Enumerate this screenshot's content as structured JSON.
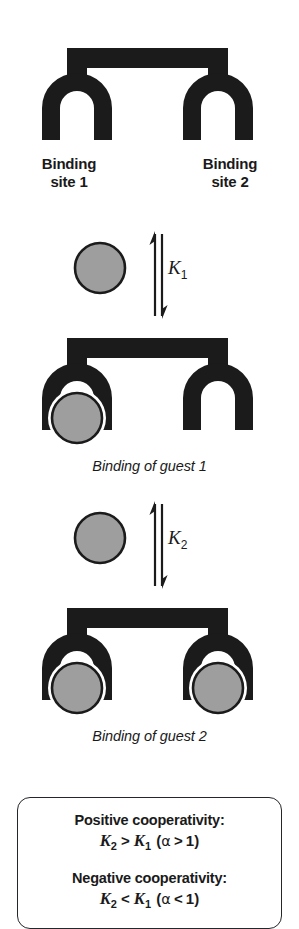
{
  "figure": {
    "type": "host-guest cooperative binding scheme",
    "colors": {
      "host": "#1b1b1b",
      "guest_fill": "#9e9e9e",
      "guest_stroke": "#1b1b1b",
      "background": "#ffffff",
      "box_border": "#23262b",
      "text": "#1a1a1a"
    }
  },
  "top_host": {
    "icon_host": "ditopic-host-icon",
    "icon_site_left": "binding-site-arch-icon",
    "icon_site_right": "binding-site-arch-icon",
    "labels": [
      {
        "line1": "Binding",
        "line2": "site 1"
      },
      {
        "line1": "Binding",
        "line2": "site 2"
      }
    ]
  },
  "step_1": {
    "guest_icon": "guest-sphere-icon",
    "arrow_icon": "equilibrium-arrow-icon",
    "constant": "K",
    "constant_sub": "1"
  },
  "mono_complex": {
    "icon_host": "ditopic-host-icon",
    "icon_guest": "guest-sphere-icon",
    "caption": "Binding of guest 1"
  },
  "step_2": {
    "guest_icon": "guest-sphere-icon",
    "arrow_icon": "equilibrium-arrow-icon",
    "constant": "K",
    "constant_sub": "2"
  },
  "bis_complex": {
    "icon_host": "ditopic-host-icon",
    "icon_guest_left": "guest-sphere-icon",
    "icon_guest_right": "guest-sphere-icon",
    "caption": "Binding of guest 2"
  },
  "cooperativity_note": {
    "positive": {
      "heading": "Positive cooperativity:",
      "formula": {
        "k_left": "K",
        "k_left_sub": "2",
        "operator": ">",
        "k_right": "K",
        "k_right_sub": "1",
        "paren_open": "(",
        "alpha": "α",
        "alpha_op": ">",
        "alpha_value": "1",
        "paren_close": ")"
      }
    },
    "negative": {
      "heading": "Negative cooperativity:",
      "formula": {
        "k_left": "K",
        "k_left_sub": "2",
        "operator": "<",
        "k_right": "K",
        "k_right_sub": "1",
        "paren_open": "(",
        "alpha": "α",
        "alpha_op": "<",
        "alpha_value": "1",
        "paren_close": ")"
      }
    }
  }
}
